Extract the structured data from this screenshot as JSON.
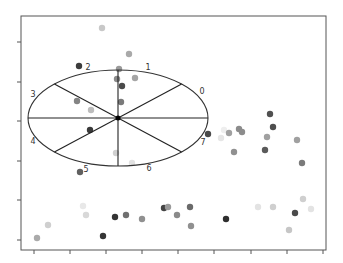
{
  "chart_data": {
    "type": "scatter",
    "title": "",
    "xlabel": "",
    "ylabel": "",
    "grid": false,
    "legend": null,
    "frame": {
      "left": 21,
      "top": 16,
      "right": 326,
      "bottom": 250
    },
    "x_ticks_px": [
      34,
      70,
      106,
      142,
      178,
      214,
      251,
      287,
      323
    ],
    "y_ticks_px": [
      42,
      82,
      121,
      161,
      200,
      240
    ],
    "tick_labels_visible": false,
    "overlay": {
      "type": "sectored-ellipse",
      "center": [
        118,
        118
      ],
      "rx": 90,
      "ry": 48,
      "sectors": 8,
      "sector_labels": [
        "0",
        "1",
        "2",
        "3",
        "4",
        "5",
        "6",
        "7"
      ],
      "label_positions": [
        [
          202,
          94
        ],
        [
          148,
          70
        ],
        [
          88,
          70
        ],
        [
          33,
          97
        ],
        [
          33,
          144
        ],
        [
          86,
          172
        ],
        [
          149,
          171
        ],
        [
          203,
          145
        ]
      ]
    },
    "points": [
      {
        "x": 102,
        "y": 28,
        "shade": "#c8c8c8"
      },
      {
        "x": 129,
        "y": 54,
        "shade": "#a9a9a9"
      },
      {
        "x": 79,
        "y": 66,
        "shade": "#3c3c3c"
      },
      {
        "x": 119,
        "y": 69,
        "shade": "#9a9a9a"
      },
      {
        "x": 117,
        "y": 79,
        "shade": "#8a8a8a"
      },
      {
        "x": 135,
        "y": 78,
        "shade": "#a5a5a5"
      },
      {
        "x": 122,
        "y": 86,
        "shade": "#4a4a4a"
      },
      {
        "x": 121,
        "y": 102,
        "shade": "#7a7a7a"
      },
      {
        "x": 77,
        "y": 101,
        "shade": "#848484"
      },
      {
        "x": 91,
        "y": 110,
        "shade": "#bdbdbd"
      },
      {
        "x": 90,
        "y": 130,
        "shade": "#3a3a3a"
      },
      {
        "x": 116,
        "y": 153,
        "shade": "#d0d0d0"
      },
      {
        "x": 132,
        "y": 163,
        "shade": "#e2e2e2"
      },
      {
        "x": 80,
        "y": 172,
        "shade": "#606060"
      },
      {
        "x": 208,
        "y": 134,
        "shade": "#4a4a4a"
      },
      {
        "x": 221,
        "y": 138,
        "shade": "#e6e6e6"
      },
      {
        "x": 224,
        "y": 130,
        "shade": "#eeeeee"
      },
      {
        "x": 229,
        "y": 133,
        "shade": "#a0a0a0"
      },
      {
        "x": 239,
        "y": 129,
        "shade": "#8c8c8c"
      },
      {
        "x": 242,
        "y": 132,
        "shade": "#8c8c8c"
      },
      {
        "x": 234,
        "y": 152,
        "shade": "#909090"
      },
      {
        "x": 270,
        "y": 114,
        "shade": "#505050"
      },
      {
        "x": 273,
        "y": 127,
        "shade": "#4e4e4e"
      },
      {
        "x": 267,
        "y": 137,
        "shade": "#a0a0a0"
      },
      {
        "x": 265,
        "y": 150,
        "shade": "#5a5a5a"
      },
      {
        "x": 297,
        "y": 140,
        "shade": "#a0a0a0"
      },
      {
        "x": 302,
        "y": 163,
        "shade": "#7a7a7a"
      },
      {
        "x": 37,
        "y": 238,
        "shade": "#aaaaaa"
      },
      {
        "x": 48,
        "y": 225,
        "shade": "#cfcfcf"
      },
      {
        "x": 83,
        "y": 206,
        "shade": "#e8e8e8"
      },
      {
        "x": 86,
        "y": 215,
        "shade": "#d8d8d8"
      },
      {
        "x": 103,
        "y": 236,
        "shade": "#353535"
      },
      {
        "x": 115,
        "y": 217,
        "shade": "#353535"
      },
      {
        "x": 126,
        "y": 215,
        "shade": "#707070"
      },
      {
        "x": 142,
        "y": 219,
        "shade": "#909090"
      },
      {
        "x": 164,
        "y": 208,
        "shade": "#444444"
      },
      {
        "x": 168,
        "y": 207,
        "shade": "#9a9a9a"
      },
      {
        "x": 177,
        "y": 215,
        "shade": "#8a8a8a"
      },
      {
        "x": 190,
        "y": 207,
        "shade": "#6a6a6a"
      },
      {
        "x": 191,
        "y": 226,
        "shade": "#909090"
      },
      {
        "x": 226,
        "y": 219,
        "shade": "#2e2e2e"
      },
      {
        "x": 258,
        "y": 207,
        "shade": "#e3e3e3"
      },
      {
        "x": 273,
        "y": 207,
        "shade": "#cfcfcf"
      },
      {
        "x": 295,
        "y": 213,
        "shade": "#4a4a4a"
      },
      {
        "x": 303,
        "y": 199,
        "shade": "#cfcfcf"
      },
      {
        "x": 311,
        "y": 209,
        "shade": "#e3e3e3"
      },
      {
        "x": 289,
        "y": 230,
        "shade": "#c6c6c6"
      }
    ]
  },
  "colors": {
    "frame": "#555555",
    "ellipse": "#333333",
    "spokes": "#222222",
    "center": "#000000",
    "background": "#ffffff"
  }
}
